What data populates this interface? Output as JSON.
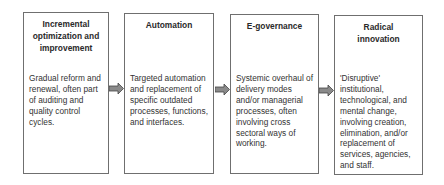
{
  "diagram": {
    "type": "process-flow",
    "stages": [
      {
        "title": "Incremental optimization and improvement",
        "description": "Gradual reform and renewal, often part of auditing and quality control cycles."
      },
      {
        "title": "Automation",
        "description": "Targeted automation and replacement of specific outdated processes, functions, and interfaces."
      },
      {
        "title": "E-governance",
        "description": "Systemic overhaul of delivery modes and/or managerial processes, often involving cross sectoral ways of working."
      },
      {
        "title": "Radical innovation",
        "description": "'Disruptive' institutional, technological, and mental change, involving creation, elimination, and/or replacement of services, agencies, and staff."
      }
    ],
    "arrow_icon": "right-block-arrow",
    "colors": {
      "border": "#6f6f6f",
      "arrow_fill": "#8a8a8a",
      "arrow_stroke": "#444444",
      "text": "#2a2a2a"
    }
  }
}
